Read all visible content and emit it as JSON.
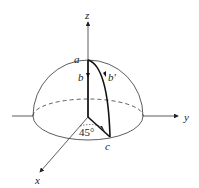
{
  "diagram": {
    "type": "hemisphere-coordinate-diagram",
    "axes": {
      "z": "z",
      "y": "y",
      "x": "x"
    },
    "points": {
      "a": "a",
      "b": "b",
      "b_prime": "b′",
      "c": "c"
    },
    "angle": "45°"
  }
}
